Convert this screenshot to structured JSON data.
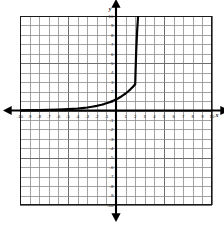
{
  "figure": {
    "kind": "cartesian-coordinate-plane",
    "background_color": "#ffffff",
    "frame": {
      "border_color": "#1a1a1a",
      "x_px": 20,
      "y_px": 16,
      "width_px": 192,
      "height_px": 189
    }
  },
  "chart_data": {
    "type": "line",
    "title": "",
    "subtitle": "",
    "xlabel": "x",
    "ylabel": "y",
    "grid": true,
    "legend": null,
    "xlim": [
      -10,
      10
    ],
    "ylim": [
      -10,
      10
    ],
    "x_ticks": [
      -10,
      -9,
      -8,
      -7,
      -6,
      -5,
      -4,
      -3,
      -2,
      -1,
      1,
      2,
      3,
      4,
      5,
      6,
      7,
      8,
      9,
      10
    ],
    "y_ticks": [
      10,
      9,
      8,
      7,
      6,
      5,
      4,
      3,
      2,
      1,
      -1,
      -2,
      -3,
      -4,
      -5,
      -6,
      -7,
      -8,
      -9,
      -10
    ],
    "x_tick_labels": [
      "-10",
      "-9",
      "-8",
      "-7",
      "-6",
      "-5",
      "-4",
      "-3",
      "-2",
      "-1",
      "1",
      "2",
      "3",
      "4",
      "5",
      "6",
      "7",
      "8",
      "9",
      "10"
    ],
    "y_tick_labels": [
      "10",
      "9",
      "8",
      "7",
      "6",
      "5",
      "4",
      "3",
      "2",
      "1",
      "-1",
      "-2",
      "-3",
      "-4",
      "-5",
      "-6",
      "-7",
      "-8",
      "-9",
      "-10"
    ],
    "gridline_step": 1,
    "series": [
      {
        "name": "exponential-curve",
        "color": "#000000",
        "line_width_px": 2.2,
        "description": "increasing exponential, horizontal asymptote y=0, passes through (0,1)",
        "x": [
          -10,
          -9,
          -8,
          -7,
          -6,
          -5,
          -4.5,
          -4,
          -3.5,
          -3,
          -2.5,
          -2,
          -1.75,
          -1.5,
          -1.25,
          -1,
          -0.75,
          -0.5,
          -0.25,
          0,
          0.25,
          0.5,
          0.75,
          1,
          1.25,
          1.5,
          1.75,
          2,
          2.1,
          2.2,
          2.3
        ],
        "y": [
          0.02,
          0.03,
          0.04,
          0.06,
          0.09,
          0.14,
          0.17,
          0.21,
          0.26,
          0.32,
          0.4,
          0.49,
          0.55,
          0.61,
          0.68,
          0.76,
          0.84,
          0.94,
          1.05,
          1.17,
          1.3,
          1.45,
          1.62,
          1.8,
          2.01,
          2.24,
          2.49,
          2.78,
          6.2,
          8.4,
          10.0
        ]
      }
    ],
    "axes": {
      "x_axis_y_value": 0,
      "y_axis_x_value": 0,
      "axis_color": "#000000",
      "arrows": [
        "left",
        "right",
        "up",
        "down"
      ]
    },
    "annotations": [
      {
        "text": "y",
        "x_px": 110,
        "y_px": 11,
        "role": "y-axis-name"
      },
      {
        "text": "x",
        "x_px": 217,
        "y_px": 117,
        "role": "x-axis-name"
      }
    ]
  },
  "colors": {
    "grid_minor": "#8c8c8c",
    "grid_major": "#6e6e6e",
    "axis": "#000000",
    "curve": "#000000",
    "tick_text": "#1a1a1a",
    "frame": "#1a1a1a"
  }
}
